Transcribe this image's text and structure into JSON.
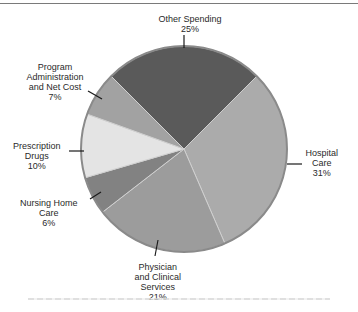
{
  "chart_data": {
    "type": "pie",
    "title": "",
    "center": [
      184,
      149
    ],
    "radius": 103,
    "start_angle_deg": 315,
    "slices": [
      {
        "name": "Other Spending",
        "lines": [
          "Other Spending"
        ],
        "value": 25,
        "label": "25%",
        "color": "#5a5a5a"
      },
      {
        "name": "Hospital Care",
        "lines": [
          "Hospital",
          "Care"
        ],
        "value": 31,
        "label": "31%",
        "color": "#ababab"
      },
      {
        "name": "Physician and Clinical Services",
        "lines": [
          "Physician",
          "and Clinical",
          "Services"
        ],
        "value": 21,
        "label": "21%",
        "color": "#9c9c9c"
      },
      {
        "name": "Nursing Home Care",
        "lines": [
          "Nursing Home",
          "Care"
        ],
        "value": 6,
        "label": "6%",
        "color": "#828282"
      },
      {
        "name": "Prescription Drugs",
        "lines": [
          "Prescription",
          "Drugs"
        ],
        "value": 10,
        "label": "10%",
        "color": "#e4e4e4"
      },
      {
        "name": "Program Administration and Net Cost",
        "lines": [
          "Program",
          "Administration",
          "and Net Cost"
        ],
        "value": 7,
        "label": "7%",
        "color": "#a2a2a2"
      }
    ],
    "labels_layout": [
      {
        "x": 190,
        "y": 14,
        "lx1": 184,
        "ly1": 35,
        "lx2": 184,
        "ly2": 48
      },
      {
        "x": 322,
        "y": 148,
        "lx1": 287,
        "ly1": 164,
        "lx2": 302,
        "ly2": 164
      },
      {
        "x": 158,
        "y": 262,
        "lx1": 158,
        "ly1": 240,
        "lx2": 155,
        "ly2": 256
      },
      {
        "x": 49,
        "y": 198,
        "lx1": 90,
        "ly1": 199,
        "lx2": 101,
        "ly2": 192
      },
      {
        "x": 37,
        "y": 141,
        "lx1": 69,
        "ly1": 151,
        "lx2": 84,
        "ly2": 151
      },
      {
        "x": 55,
        "y": 62,
        "lx1": 88,
        "ly1": 91,
        "lx2": 102,
        "ly2": 99
      }
    ]
  }
}
